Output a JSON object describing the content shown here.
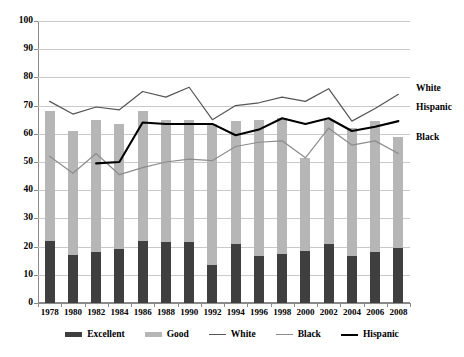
{
  "chart_data": {
    "type": "bar",
    "title": "",
    "xlabel": "",
    "ylabel": "",
    "ylim": [
      0,
      100
    ],
    "yticks": [
      0,
      10,
      20,
      30,
      40,
      50,
      60,
      70,
      80,
      90,
      100
    ],
    "grid": true,
    "legend_position": "bottom",
    "categories": [
      "1978",
      "1980",
      "1982",
      "1984",
      "1986",
      "1988",
      "1990",
      "1992",
      "1994",
      "1996",
      "1998",
      "2000",
      "2002",
      "2004",
      "2006",
      "2008"
    ],
    "series": [
      {
        "name": "Excellent",
        "type": "bar-segment",
        "color": "#3f3f3f",
        "values": [
          22,
          17,
          18,
          19,
          22,
          21.5,
          21.5,
          13.5,
          21,
          16.5,
          17.5,
          18.5,
          21,
          16.5,
          18,
          19.5
        ]
      },
      {
        "name": "Good",
        "type": "bar-segment",
        "color": "#b6b6b6",
        "values": [
          46,
          44,
          47,
          44.5,
          46,
          43.5,
          43.5,
          50,
          43.5,
          48.5,
          48,
          33,
          44,
          45.5,
          46.5,
          39.5
        ]
      },
      {
        "name": "White",
        "type": "line",
        "color": "#555555",
        "values": [
          71.5,
          67,
          69.5,
          68.5,
          75,
          73,
          76.5,
          65,
          70,
          71,
          73,
          71.5,
          76,
          64.5,
          69,
          74
        ]
      },
      {
        "name": "Black",
        "type": "line",
        "color": "#8c8c8c",
        "values": [
          52,
          46,
          53,
          45.5,
          48,
          50,
          51,
          50.5,
          55.5,
          57,
          57.5,
          51.5,
          62,
          56,
          57.5,
          53
        ]
      },
      {
        "name": "Hispanic",
        "type": "line",
        "color": "#000000",
        "values": [
          null,
          null,
          49.5,
          50,
          64,
          63.5,
          63.5,
          63.5,
          59.5,
          61.5,
          65.5,
          63.5,
          65.5,
          61,
          62.5,
          64.5
        ]
      }
    ],
    "bar_totals": [
      68,
      61,
      65,
      63.5,
      68,
      65,
      65,
      63.5,
      64.5,
      65,
      65.5,
      51.5,
      65,
      62,
      64.5,
      59
    ],
    "inline_labels": [
      {
        "text": "White",
        "value": 76
      },
      {
        "text": "Hispanic",
        "value": 69
      },
      {
        "text": "Black",
        "value": 58.5
      }
    ]
  },
  "legend": {
    "items": [
      {
        "label": "Excellent",
        "marker": "bar",
        "color": "#3f3f3f"
      },
      {
        "label": "Good",
        "marker": "bar",
        "color": "#b6b6b6"
      },
      {
        "label": "White",
        "marker": "line",
        "color": "#555555"
      },
      {
        "label": "Black",
        "marker": "line",
        "color": "#8c8c8c"
      },
      {
        "label": "Hispanic",
        "marker": "line",
        "color": "#000000"
      }
    ]
  }
}
